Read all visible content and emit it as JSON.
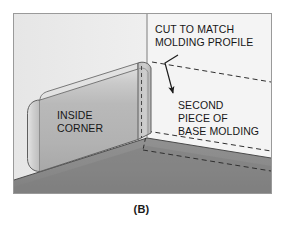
{
  "figure": {
    "caption": "(B)",
    "labels": {
      "inside_corner": [
        "INSIDE",
        "CORNER"
      ],
      "cut_to_match": [
        "CUT TO MATCH",
        "MOLDING PROFILE"
      ],
      "second_piece": [
        "SECOND",
        "PIECE OF",
        "BASE MOLDING"
      ]
    },
    "colors": {
      "frame_border": "#9a9a9a",
      "wall_left": "#ececec",
      "wall_right": "#f2f2f2",
      "floor": "#8b8b8b",
      "floor_shadow": "#7c7c7c",
      "molding_face": "#b8b8b8",
      "molding_bevel": "#d8d8d8",
      "molding_cap": "#c6c6c6",
      "molding_edge": "#5a5a5a",
      "line": "#2a2a2a",
      "text": "#171717",
      "background": "#ffffff"
    }
  }
}
